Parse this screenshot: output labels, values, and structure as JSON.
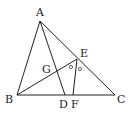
{
  "diagram": {
    "type": "geometry-triangle",
    "points": {
      "A": {
        "label": "A",
        "x": 40,
        "y": 21,
        "lx": 36,
        "ly": 16
      },
      "B": {
        "label": "B",
        "x": 17,
        "y": 95,
        "lx": 5,
        "ly": 103
      },
      "C": {
        "label": "C",
        "x": 115,
        "y": 95,
        "lx": 117,
        "ly": 103
      },
      "D": {
        "label": "D",
        "x": 65,
        "y": 95,
        "lx": 59,
        "ly": 108
      },
      "E": {
        "label": "E",
        "x": 77,
        "y": 59,
        "lx": 80,
        "ly": 57
      },
      "F": {
        "label": "F",
        "x": 73,
        "y": 95,
        "lx": 71,
        "ly": 108
      },
      "G": {
        "label": "G",
        "x": 57,
        "y": 72,
        "lx": 42,
        "ly": 73
      }
    },
    "segments": [
      [
        "A",
        "B"
      ],
      [
        "B",
        "C"
      ],
      [
        "C",
        "A"
      ],
      [
        "A",
        "D"
      ],
      [
        "B",
        "E"
      ],
      [
        "E",
        "F"
      ]
    ],
    "angle_marks": [
      {
        "at": "E",
        "symbol": "○",
        "x": 71,
        "y": 67
      },
      {
        "at": "E",
        "symbol": "○",
        "x": 80,
        "y": 69
      }
    ],
    "colors": {
      "stroke": "#222222",
      "background": "#ffffff"
    }
  }
}
